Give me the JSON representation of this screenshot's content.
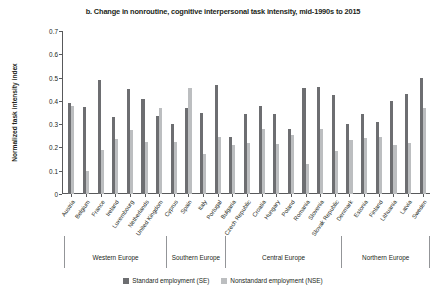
{
  "chart_data": {
    "type": "bar",
    "title": "b. Change in nonroutine, cognitive interpersonal task intensity, mid-1990s to 2015",
    "xlabel": "",
    "ylabel": "Normalized task intensity index",
    "ylim": [
      0,
      0.7
    ],
    "yticks": [
      "0",
      "0.1",
      "0.2",
      "0.3",
      "0.4",
      "0.5",
      "0.6",
      "0.7"
    ],
    "ytick_values": [
      0,
      0.1,
      0.2,
      0.3,
      0.4,
      0.5,
      0.6,
      0.7
    ],
    "grid": false,
    "legend_position": "bottom",
    "categories": [
      "Austria",
      "Belgium",
      "France",
      "Ireland",
      "Luxembourg",
      "Netherlands",
      "United Kingdom",
      "Cyprus",
      "Spain",
      "Italy",
      "Portugal",
      "Bulgaria",
      "Czech Republic",
      "Croatia",
      "Hungary",
      "Poland",
      "Romania",
      "Slovenia",
      "Slovak Republic",
      "Denmark",
      "Estonia",
      "Finland",
      "Lithuania",
      "Latvia",
      "Sweden"
    ],
    "series": [
      {
        "name": "Standard employment (SE)",
        "color": "#6d6e71",
        "values": [
          0.39,
          0.375,
          0.49,
          0.33,
          0.45,
          0.41,
          0.335,
          0.3,
          0.37,
          0.35,
          0.47,
          0.245,
          0.345,
          0.38,
          0.345,
          0.28,
          0.455,
          0.46,
          0.425,
          0.3,
          0.345,
          0.31,
          0.4,
          0.43,
          0.5
        ]
      },
      {
        "name": "Nonstandard employment (NSE)",
        "color": "#bcbec0",
        "values": [
          0.38,
          0.1,
          0.19,
          0.235,
          0.275,
          0.225,
          0.37,
          0.225,
          0.455,
          0.17,
          0.245,
          0.21,
          0.22,
          0.28,
          0.215,
          0.255,
          0.13,
          0.28,
          0.185,
          0.23,
          0.24,
          0.245,
          0.21,
          0.22,
          0.37
        ]
      }
    ],
    "regions": [
      {
        "label": "Western Europe",
        "count": 7
      },
      {
        "label": "Southern Europe",
        "count": 4
      },
      {
        "label": "Central Europe",
        "count": 8
      },
      {
        "label": "Northern Europe",
        "count": 6
      }
    ]
  }
}
